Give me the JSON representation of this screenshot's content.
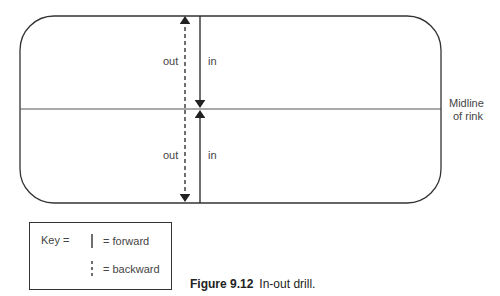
{
  "diagram": {
    "labels": {
      "out_top": "out",
      "in_top": "in",
      "out_bottom": "out",
      "in_bottom": "in",
      "midline": [
        "Midline",
        "of rink"
      ]
    },
    "key": {
      "title": "Key =",
      "forward": "= forward",
      "backward": "= backward"
    },
    "caption": {
      "figure": "Figure 9.12",
      "text": "In-out drill."
    }
  }
}
